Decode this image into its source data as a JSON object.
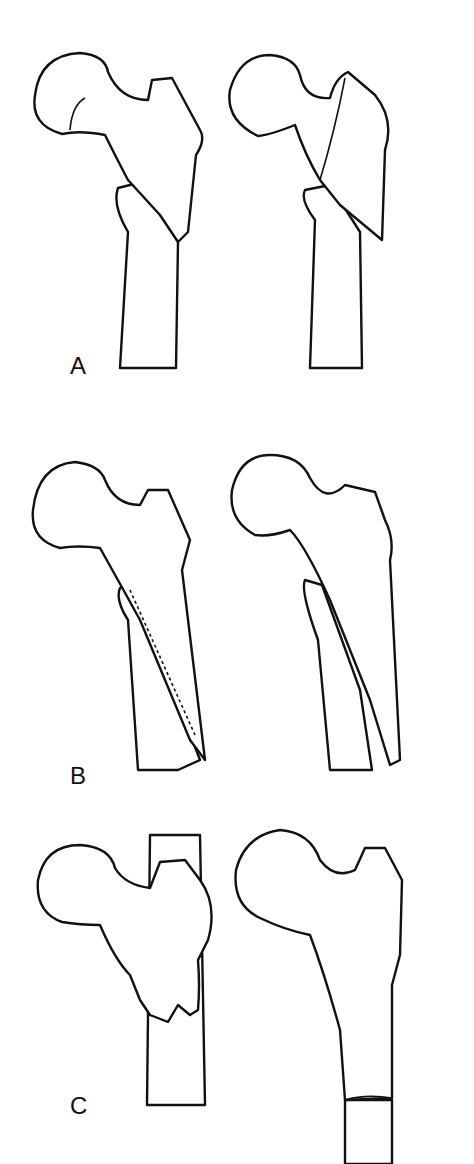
{
  "figure": {
    "panels": [
      {
        "label": "A",
        "views": [
          "left-femur",
          "right-femur"
        ]
      },
      {
        "label": "B",
        "views": [
          "left-femur",
          "right-femur"
        ]
      },
      {
        "label": "C",
        "views": [
          "left-femur",
          "right-femur"
        ]
      }
    ]
  }
}
